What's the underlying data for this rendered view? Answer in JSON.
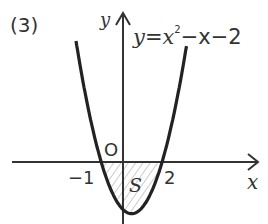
{
  "problem_number": "(3)",
  "equation": {
    "lhs": "y",
    "eq": "=",
    "x": "x",
    "exp": "2",
    "rest": "−x−2"
  },
  "axes": {
    "x_label": "x",
    "y_label": "y",
    "origin_label": "O"
  },
  "ticks": {
    "left_root": "−1",
    "right_root": "2"
  },
  "region_label": "S",
  "colors": {
    "curve": "#222222",
    "axis": "#333333",
    "hatch": "#aaaaaa"
  }
}
